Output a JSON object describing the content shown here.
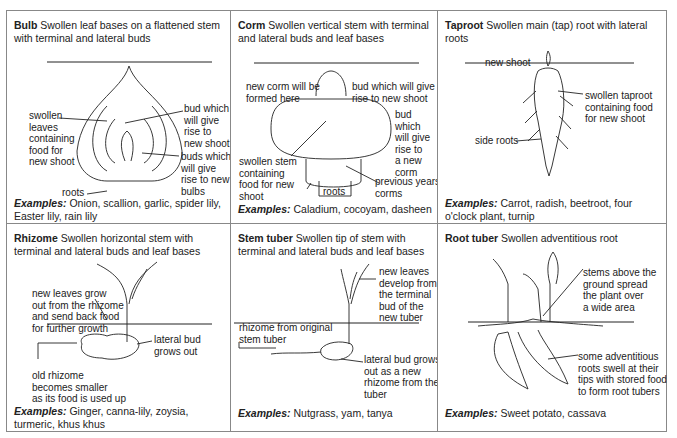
{
  "cells": [
    {
      "name": "Bulb",
      "description": "Swollen leaf bases on a flattened stem with terminal and lateral buds",
      "labels": {
        "swollen_leaves": "swollen\nleaves\ncontaining\nfood for\nnew shoot",
        "bud": "bud which\nwill give\nrise to\nnew shoot",
        "buds": "buds which\nwill give\nrise to new\nbulbs",
        "roots": "roots"
      },
      "examples_label": "Examples:",
      "examples": "Onion, scallion, garlic, spider lily, Easter lily, rain lily"
    },
    {
      "name": "Corm",
      "description": "Swollen vertical stem with terminal and lateral buds and leaf bases",
      "labels": {
        "new_corm": "new corm will be\nformed here",
        "bud_shoot": "bud which will give\nrise to new shoot",
        "bud_corm": "bud\nwhich\nwill give\nrise to\na new\ncorm",
        "swollen_stem": "swollen stem\ncontaining\nfood for new\nshoot",
        "roots": "roots",
        "previous": "previous years'\ncorms"
      },
      "examples_label": "Examples:",
      "examples": "Caladium, cocoyam, dasheen"
    },
    {
      "name": "Taproot",
      "description": "Swollen main (tap) root with lateral roots",
      "labels": {
        "new_shoot": "new shoot",
        "swollen_taproot": "swollen taproot\ncontaining food\nfor new shoot",
        "side_roots": "side roots"
      },
      "examples_label": "Examples:",
      "examples": "Carrot, radish, beetroot, four o'clock plant, turnip"
    },
    {
      "name": "Rhizome",
      "description": "Swollen horizontal stem with terminal and lateral buds and leaf bases",
      "labels": {
        "new_leaves": "new leaves grow\nout from the rhizome\nand send back food\nfor further growth",
        "lateral_bud": "lateral bud\ngrows out",
        "old_rhizome": "old rhizome\nbecomes smaller\nas its food is used up"
      },
      "examples_label": "Examples:",
      "examples": "Ginger, canna-lily, zoysia, turmeric, khus khus"
    },
    {
      "name": "Stem tuber",
      "description": "Swollen tip of stem with terminal and lateral buds and leaf bases",
      "labels": {
        "new_leaves": "new leaves\ndevelop from\nthe terminal\nbud of the\nnew tuber",
        "rhizome_original": "rhizome from original\nstem tuber",
        "lateral_bud": "lateral bud grows\nout as a new\nrhizome from the\ntuber"
      },
      "examples_label": "Examples:",
      "examples": "Nutgrass, yam, tanya"
    },
    {
      "name": "Root tuber",
      "description": "Swollen adventitious root",
      "labels": {
        "stems_above": "stems above the\nground spread\nthe plant over\na wide area",
        "adventitious": "some adventitious\nroots swell at their\ntips with stored food\nto form root tubers"
      },
      "examples_label": "Examples:",
      "examples": "Sweet potato, cassava"
    }
  ],
  "colors": {
    "border": "#888888",
    "text": "#222222",
    "background": "#ffffff"
  }
}
